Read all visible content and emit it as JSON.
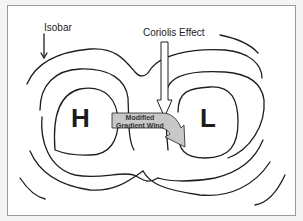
{
  "diagram": {
    "labels": {
      "isobar": "Isobar",
      "coriolis": "Coriolis Effect",
      "high": "H",
      "low": "L",
      "wind_line1": "Modified",
      "wind_line2": "Gradient Wind"
    },
    "colors": {
      "line": "#1e1e1e",
      "arrow_fill": "#c8c8c8",
      "coriolis_fill": "#ffffff",
      "frame": "#9a9a9a"
    }
  }
}
